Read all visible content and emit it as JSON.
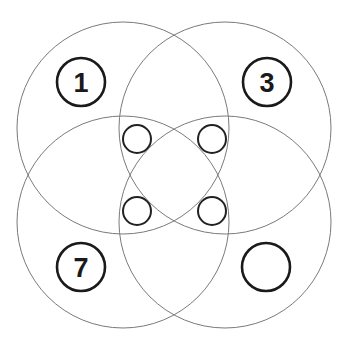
{
  "diagram": {
    "type": "four-circle-venn-puzzle",
    "big_circles": [
      {
        "id": "top-left",
        "cx": 123,
        "cy": 128,
        "r": 106
      },
      {
        "id": "top-right",
        "cx": 225,
        "cy": 128,
        "r": 106
      },
      {
        "id": "bottom-left",
        "cx": 123,
        "cy": 222,
        "r": 106
      },
      {
        "id": "bottom-right",
        "cx": 225,
        "cy": 222,
        "r": 106
      }
    ],
    "small_circles": [
      {
        "id": "inner-top-left",
        "cx": 137,
        "cy": 139,
        "r": 14
      },
      {
        "id": "inner-top-right",
        "cx": 212,
        "cy": 139,
        "r": 14
      },
      {
        "id": "inner-bottom-left",
        "cx": 137,
        "cy": 211,
        "r": 14
      },
      {
        "id": "inner-bottom-right",
        "cx": 212,
        "cy": 211,
        "r": 14
      }
    ],
    "labels": [
      {
        "id": "label-1",
        "text": "1",
        "cx": 81,
        "cy": 82,
        "r": 24
      },
      {
        "id": "label-3",
        "text": "3",
        "cx": 267,
        "cy": 82,
        "r": 24
      },
      {
        "id": "label-7",
        "text": "7",
        "cx": 81,
        "cy": 267,
        "r": 24
      },
      {
        "id": "label-missing",
        "text": "",
        "cx": 266,
        "cy": 267,
        "r": 24
      }
    ]
  }
}
